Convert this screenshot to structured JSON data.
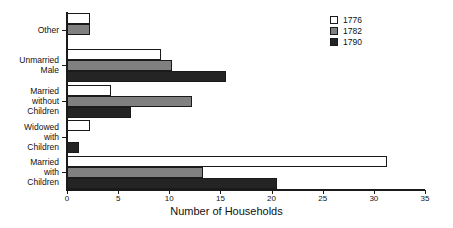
{
  "chart_data": {
    "type": "bar",
    "orientation": "horizontal",
    "title": "",
    "xlabel": "Number of Households",
    "ylabel": "",
    "xlim": [
      0,
      35
    ],
    "xticks": [
      0,
      5,
      10,
      15,
      20,
      25,
      30,
      35
    ],
    "xtick_labels": [
      "0",
      "5",
      "10",
      "15",
      "20",
      "25",
      "30",
      "35"
    ],
    "grid": false,
    "legend_position": "top-right",
    "categories": [
      "Other",
      "Unmarried\nMale",
      "Married\nwithout\nChildren",
      "Widowed\nwith\nChildren",
      "Married\nwith\nChildren"
    ],
    "series": [
      {
        "name": "1776",
        "color": "#ffffff",
        "values": [
          2.2,
          9.2,
          4.3,
          2.2,
          31.3
        ]
      },
      {
        "name": "1782",
        "color": "#808080",
        "values": [
          2.2,
          10.3,
          12.2,
          0,
          13.3
        ]
      },
      {
        "name": "1790",
        "color": "#242424",
        "values": [
          0,
          15.5,
          6.3,
          1.2,
          20.5
        ]
      }
    ]
  },
  "legend": {
    "items": [
      {
        "label": "1776",
        "color": "#ffffff"
      },
      {
        "label": "1782",
        "color": "#808080"
      },
      {
        "label": "1790",
        "color": "#242424"
      }
    ]
  },
  "axis": {
    "x_title": "Number of Households",
    "tick_labels": [
      "0",
      "5",
      "10",
      "15",
      "20",
      "25",
      "30",
      "35"
    ]
  },
  "categories": [
    {
      "label": "Other"
    },
    {
      "label": "Unmarried\nMale"
    },
    {
      "label": "Married\nwithout\nChildren"
    },
    {
      "label": "Widowed\nwith\nChildren"
    },
    {
      "label": "Married\nwith\nChildren"
    }
  ]
}
